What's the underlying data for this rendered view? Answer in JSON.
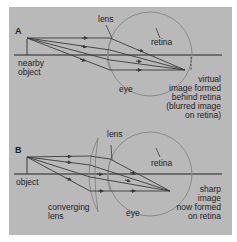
{
  "panel_a": {
    "letter": "A",
    "labels": {
      "lens": "lens",
      "retina": "retina",
      "object_line1": "nearby",
      "object_line2": "object",
      "eye": "eye",
      "image_line1": "virtual",
      "image_line2": "image formed",
      "image_line3": "behind retina",
      "image_line4": "(blurred image",
      "image_line5": "on retina)"
    }
  },
  "panel_b": {
    "letter": "B",
    "labels": {
      "lens": "lens",
      "retina": "retina",
      "object": "object",
      "converging_line1": "converging",
      "converging_line2": "lens",
      "eye": "eye",
      "image_line1": "sharp",
      "image_line2": "image",
      "image_line3": "now formed",
      "image_line4": "on retina"
    }
  },
  "colors": {
    "background": "#b9b9b9",
    "line": "#3a3a3a",
    "eye_outline": "#8a8a8a"
  }
}
